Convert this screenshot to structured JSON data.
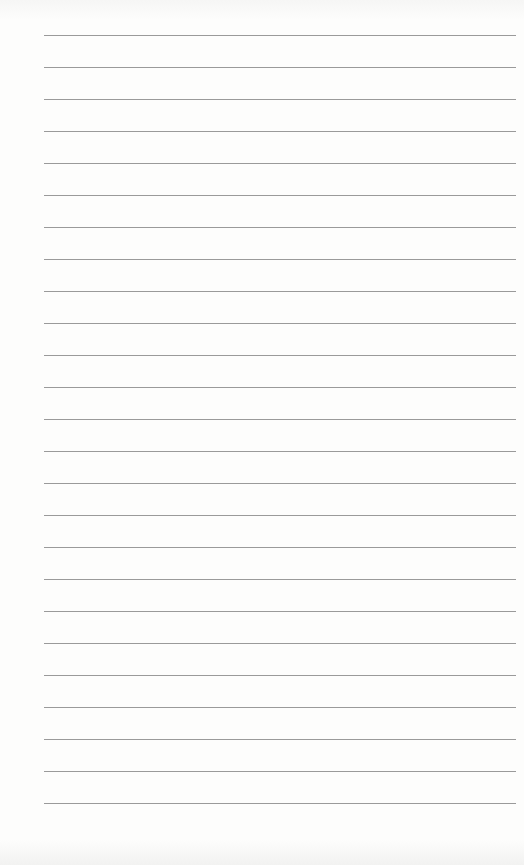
{
  "page": {
    "type": "lined-paper",
    "line_count": 25,
    "first_line_y": 35,
    "line_spacing": 32,
    "line_left": 44,
    "line_right": 516,
    "line_color": "#9a9a9a",
    "paper_color": "#fdfdfc"
  }
}
